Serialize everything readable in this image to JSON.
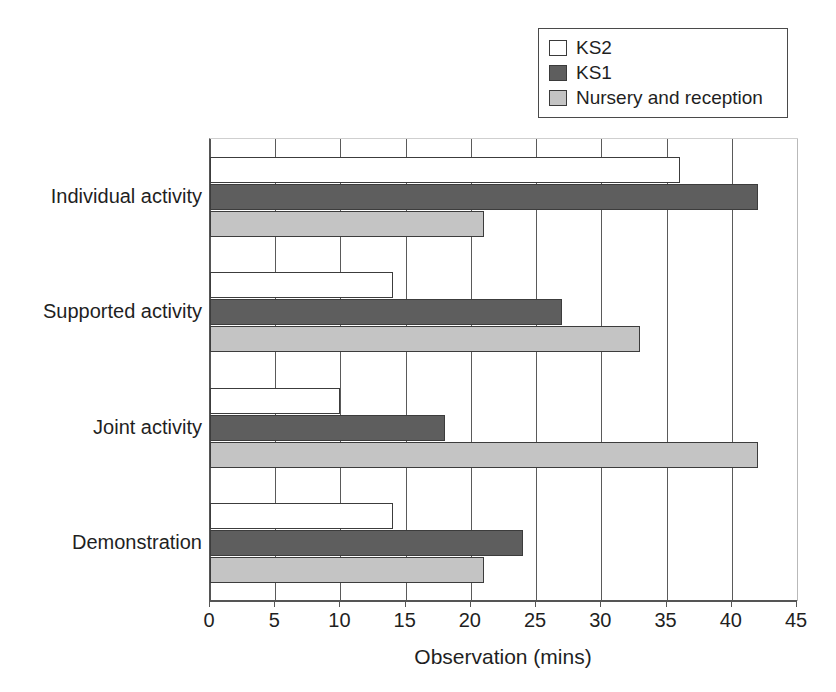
{
  "chart_data": {
    "type": "bar",
    "orientation": "horizontal",
    "title": "",
    "xlabel": "Observation (mins)",
    "ylabel": "",
    "xlim": [
      0,
      45
    ],
    "xticks": [
      "0",
      "5",
      "10",
      "15",
      "20",
      "25",
      "30",
      "35",
      "40",
      "45"
    ],
    "grid": true,
    "legend_position": "top-right",
    "categories": [
      "Individual activity",
      "Supported activity",
      "Joint activity",
      "Demonstration"
    ],
    "series": [
      {
        "name": "KS2",
        "color": "#ffffff",
        "values": [
          36,
          14,
          10,
          14
        ]
      },
      {
        "name": "KS1",
        "color": "#5e5e5e",
        "values": [
          42,
          27,
          18,
          24
        ]
      },
      {
        "name": "Nursery and reception",
        "color": "#c4c4c4",
        "values": [
          21,
          33,
          42,
          21
        ]
      }
    ]
  },
  "legend": {
    "items": [
      {
        "label": "KS2",
        "swatch": "#ffffff"
      },
      {
        "label": "KS1",
        "swatch": "#5e5e5e"
      },
      {
        "label": "Nursery and reception",
        "swatch": "#c4c4c4"
      }
    ]
  },
  "axis": {
    "x_title": "Observation (mins)",
    "tick_labels": [
      "0",
      "5",
      "10",
      "15",
      "20",
      "25",
      "30",
      "35",
      "40",
      "45"
    ]
  },
  "categories": [
    {
      "label": "Individual activity"
    },
    {
      "label": "Supported activity"
    },
    {
      "label": "Joint activity"
    },
    {
      "label": "Demonstration"
    }
  ]
}
